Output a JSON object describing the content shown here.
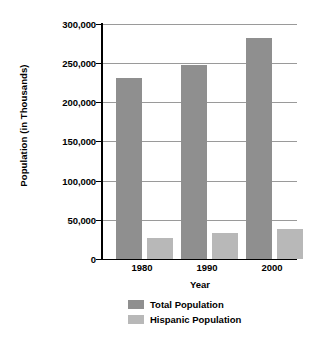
{
  "chart_data": {
    "type": "bar",
    "title": "",
    "xlabel": "Year",
    "ylabel": "Population (in Thousands)",
    "categories": [
      "1980",
      "1990",
      "2000"
    ],
    "series": [
      {
        "name": "Total Population",
        "color": "#8f8f8f",
        "values": [
          231000,
          248000,
          282000
        ]
      },
      {
        "name": "Hispanic Population",
        "color": "#b8b8b8",
        "values": [
          27000,
          33000,
          38000
        ]
      }
    ],
    "ylim": [
      0,
      300000
    ],
    "ytick_values": [
      0,
      50000,
      100000,
      150000,
      200000,
      250000,
      300000
    ],
    "ytick_labels": [
      "0",
      "50,000",
      "100,000",
      "150,000",
      "200,000",
      "250,000",
      "300,000"
    ],
    "grid": true,
    "grid_axis": "y",
    "legend_position": "bottom"
  },
  "axes": {
    "y_title": "Population (in Thousands)",
    "x_title": "Year",
    "x_tick_labels": [
      "1980",
      "1990",
      "2000"
    ],
    "y_tick_labels": [
      "300,000",
      "250,000",
      "200,000",
      "150,000",
      "100,000",
      "50,000",
      "0"
    ]
  },
  "legend": {
    "items": [
      {
        "label": "Total Population",
        "color": "#8f8f8f"
      },
      {
        "label": "Hispanic Population",
        "color": "#b8b8b8"
      }
    ]
  },
  "colors": {
    "total_population": "#8f8f8f",
    "hispanic_population": "#b8b8b8",
    "gridline": "#9a9a9a",
    "axis": "#000000",
    "background": "#ffffff"
  }
}
